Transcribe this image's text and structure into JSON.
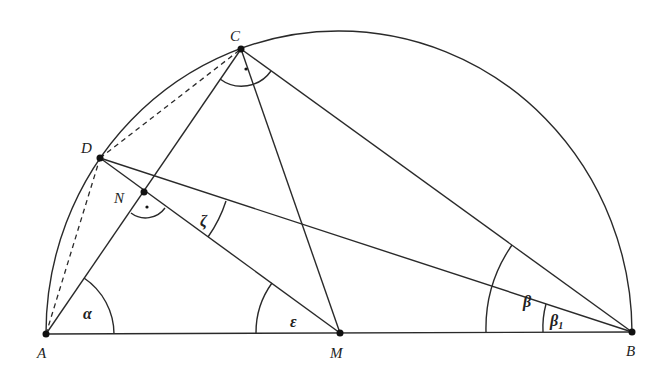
{
  "diagram": {
    "type": "geometry-semicircle",
    "points": {
      "A": {
        "label": "A",
        "x": 46,
        "y": 334
      },
      "B": {
        "label": "B",
        "x": 632,
        "y": 332
      },
      "M": {
        "label": "M",
        "x": 340,
        "y": 333
      },
      "C": {
        "label": "C",
        "x": 241,
        "y": 49
      },
      "D": {
        "label": "D",
        "x": 100,
        "y": 158
      },
      "N": {
        "label": "N",
        "x": 144,
        "y": 192
      }
    },
    "angles": {
      "alpha": {
        "label": "α"
      },
      "epsilon": {
        "label": "ε"
      },
      "zeta": {
        "label": "ζ"
      },
      "beta": {
        "label": "β"
      },
      "beta1": {
        "label": "β",
        "subscript": "1"
      }
    },
    "right_angle_marks": [
      "C",
      "N"
    ],
    "segments_solid": [
      "AB",
      "AC",
      "CB",
      "CM",
      "DB",
      "DM"
    ],
    "segments_dashed": [
      "AD",
      "DC"
    ],
    "arc": "semicircle over AB centered at M"
  }
}
